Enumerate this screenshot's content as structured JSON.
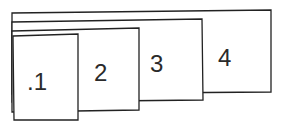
{
  "diagram": {
    "type": "stacked-cards",
    "stroke_color": "#222222",
    "fill_color": "#ffffff",
    "cards": [
      {
        "label": "4"
      },
      {
        "label": "3"
      },
      {
        "label": "2"
      },
      {
        "label": ".1"
      }
    ]
  }
}
